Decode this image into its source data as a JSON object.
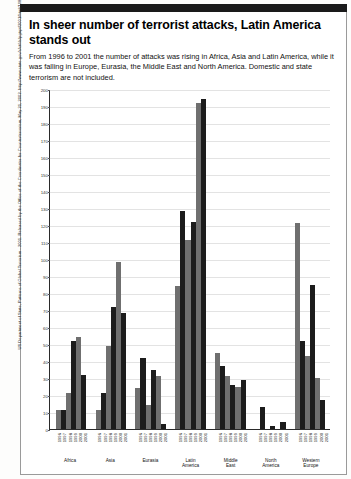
{
  "headline": "In sheer number of terrorist attacks,\nLatin America stands out",
  "deck": "From 1996 to 2001 the number of attacks was rising in Africa, Asia and Latin America, while it was falling in Europe, Eurasia, the Middle East and North America. Domestic and state terrorism are not included.",
  "source": "US Department of State, Patterns of Global Terrorism - 2001. Released by the Office of the Coordinator for Counterterrorism, May 21, 2002. http://www.state.gov/s/ct/rls/pgtrpt/2001/html/10837pf.htm",
  "colors": {
    "bar_dark": "#1c1c1c",
    "bar_light": "#6f6f6f",
    "axis": "#2a2a2a",
    "grid": "#e3e3e3",
    "topbar": "#1a1a1a"
  },
  "chart_data": {
    "type": "bar",
    "title": "In sheer number of terrorist attacks, Latin America stands out",
    "xlabel": "",
    "ylabel": "",
    "ylim": [
      0,
      200
    ],
    "ytick_step": 10,
    "grid": true,
    "legend": "none",
    "categories": [
      "Africa",
      "Asia",
      "Eurasia",
      "Latin America",
      "Middle East",
      "North America",
      "Western Europe"
    ],
    "years": [
      "1996",
      "1997",
      "1998",
      "1999",
      "2000",
      "2001"
    ],
    "yticks": [
      0,
      10,
      20,
      30,
      40,
      50,
      60,
      70,
      80,
      90,
      100,
      110,
      120,
      130,
      140,
      150,
      160,
      170,
      180,
      190,
      200
    ],
    "groups": [
      {
        "region": "Africa",
        "region_display": "Africa",
        "values": [
          11,
          11,
          21,
          52,
          54,
          32
        ]
      },
      {
        "region": "Asia",
        "region_display": "Asia",
        "values": [
          11,
          21,
          49,
          72,
          98,
          68
        ]
      },
      {
        "region": "Eurasia",
        "region_display": "Eurasia",
        "values": [
          24,
          42,
          14,
          35,
          31,
          3
        ]
      },
      {
        "region": "Latin America",
        "region_display": "Latin\nAmerica",
        "values": [
          84,
          128,
          111,
          122,
          192,
          194
        ]
      },
      {
        "region": "Middle East",
        "region_display": "Middle\nEast",
        "values": [
          45,
          37,
          31,
          26,
          25,
          29
        ]
      },
      {
        "region": "North America",
        "region_display": "North\nAmerica",
        "values": [
          0,
          13,
          0,
          2,
          0,
          4
        ]
      },
      {
        "region": "Western Europe",
        "region_display": "Western\nEurope",
        "values": [
          121,
          52,
          43,
          85,
          30,
          17
        ]
      }
    ]
  }
}
